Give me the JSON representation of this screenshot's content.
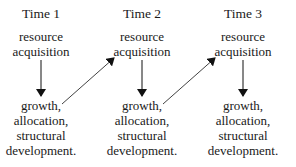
{
  "diagram": {
    "columns": [
      {
        "time_label": "Time 1",
        "top_lines": [
          "resource",
          "acquisition"
        ],
        "bottom_lines": [
          "growth,",
          "allocation,",
          "structural",
          "development."
        ]
      },
      {
        "time_label": "Time 2",
        "top_lines": [
          "resource",
          "acquisition"
        ],
        "bottom_lines": [
          "growth,",
          "allocation,",
          "structural",
          "development."
        ]
      },
      {
        "time_label": "Time 3",
        "top_lines": [
          "resource",
          "acquisition"
        ],
        "bottom_lines": [
          "growth,",
          "allocation,",
          "structural",
          "development."
        ]
      }
    ],
    "arrows": [
      {
        "from": "Time 1 resource acquisition",
        "to": "Time 1 growth, allocation, structural development.",
        "direction": "down"
      },
      {
        "from": "Time 1 growth, allocation, structural development.",
        "to": "Time 2 resource acquisition",
        "direction": "diagonal-up"
      },
      {
        "from": "Time 2 resource acquisition",
        "to": "Time 2 growth, allocation, structural development.",
        "direction": "down"
      },
      {
        "from": "Time 2 growth, allocation, structural development.",
        "to": "Time 3 resource acquisition",
        "direction": "diagonal-up"
      },
      {
        "from": "Time 3 resource acquisition",
        "to": "Time 3 growth, allocation, structural development.",
        "direction": "down"
      }
    ],
    "colors": {
      "text": "#1a1a1a",
      "arrow": "#111111",
      "background": "#ffffff"
    }
  }
}
